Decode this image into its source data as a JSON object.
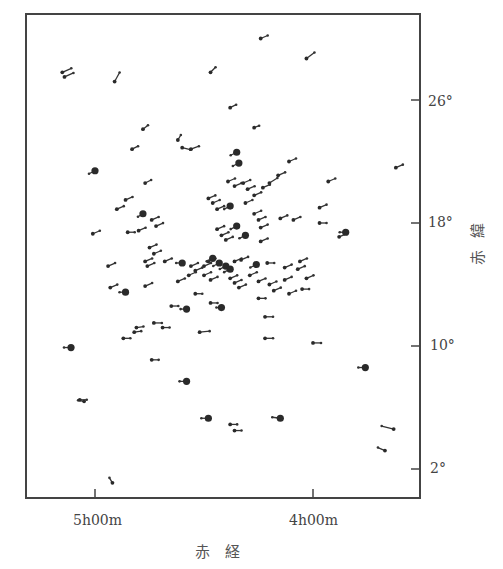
{
  "chart_data": {
    "type": "scatter",
    "title": "",
    "xlabel": "赤　経",
    "ylabel": "赤緯",
    "x_axis": {
      "quantity": "Right Ascension",
      "units": "hours",
      "direction": "decreasing to the right",
      "range": [
        5.32,
        3.52
      ],
      "ticks": [
        {
          "value": 5.0,
          "label": "5h00m"
        },
        {
          "value": 4.0,
          "label": "4h00m"
        }
      ]
    },
    "y_axis": {
      "quantity": "Declination",
      "units": "degrees",
      "range": [
        0.1,
        31.6
      ],
      "ticks": [
        {
          "value": 26,
          "label": "26°"
        },
        {
          "value": 18,
          "label": "18°"
        },
        {
          "value": 10,
          "label": "10°"
        },
        {
          "value": 2,
          "label": "2°"
        }
      ],
      "position": "right"
    },
    "grid": false,
    "legend": null,
    "marker_note": "Each star drawn as a dot with a short proper-motion line (pointing roughly toward upper-left / east); larger filled dots denote brighter stars.",
    "stars": [
      {
        "ra": 5.15,
        "dec": 27.8,
        "size": "s",
        "dx": 9,
        "dy": -4
      },
      {
        "ra": 5.14,
        "dec": 27.5,
        "size": "s",
        "dx": 9,
        "dy": -4
      },
      {
        "ra": 4.91,
        "dec": 27.2,
        "size": "s",
        "dx": 5,
        "dy": -9
      },
      {
        "ra": 4.47,
        "dec": 27.8,
        "size": "s",
        "dx": 5,
        "dy": -5
      },
      {
        "ra": 4.24,
        "dec": 30.0,
        "size": "s",
        "dx": 7,
        "dy": -3
      },
      {
        "ra": 4.03,
        "dec": 28.7,
        "size": "s",
        "dx": 8,
        "dy": -6
      },
      {
        "ra": 4.38,
        "dec": 25.5,
        "size": "s",
        "dx": 6,
        "dy": -3
      },
      {
        "ra": 4.78,
        "dec": 24.1,
        "size": "s",
        "dx": 5,
        "dy": -4
      },
      {
        "ra": 4.62,
        "dec": 23.4,
        "size": "s",
        "dx": 3,
        "dy": -5
      },
      {
        "ra": 4.6,
        "dec": 22.9,
        "size": "s",
        "dx": 8,
        "dy": 2
      },
      {
        "ra": 4.56,
        "dec": 22.8,
        "size": "s",
        "dx": 8,
        "dy": -3
      },
      {
        "ra": 4.83,
        "dec": 22.8,
        "size": "s",
        "dx": 6,
        "dy": -3
      },
      {
        "ra": 4.27,
        "dec": 24.2,
        "size": "s",
        "dx": 5,
        "dy": -2
      },
      {
        "ra": 4.35,
        "dec": 22.6,
        "size": "L",
        "dx": -6,
        "dy": 3
      },
      {
        "ra": 4.34,
        "dec": 21.9,
        "size": "L",
        "dx": -6,
        "dy": 3
      },
      {
        "ra": 4.11,
        "dec": 22.0,
        "size": "s",
        "dx": 7,
        "dy": -3
      },
      {
        "ra": 4.16,
        "dec": 21.1,
        "size": "s",
        "dx": 7,
        "dy": -3
      },
      {
        "ra": 4.2,
        "dec": 20.6,
        "size": "s",
        "dx": 8,
        "dy": -5
      },
      {
        "ra": 4.23,
        "dec": 20.3,
        "size": "s",
        "dx": 7,
        "dy": -3
      },
      {
        "ra": 4.39,
        "dec": 20.7,
        "size": "s",
        "dx": 7,
        "dy": -3
      },
      {
        "ra": 4.36,
        "dec": 20.4,
        "size": "s",
        "dx": 7,
        "dy": -3
      },
      {
        "ra": 4.32,
        "dec": 20.6,
        "size": "s",
        "dx": 7,
        "dy": -3
      },
      {
        "ra": 4.3,
        "dec": 20.2,
        "size": "s",
        "dx": 7,
        "dy": -3
      },
      {
        "ra": 4.27,
        "dec": 19.8,
        "size": "s",
        "dx": 7,
        "dy": -3
      },
      {
        "ra": 5.0,
        "dec": 21.4,
        "size": "L",
        "dx": -6,
        "dy": 3
      },
      {
        "ra": 4.77,
        "dec": 20.6,
        "size": "s",
        "dx": 6,
        "dy": -3
      },
      {
        "ra": 3.93,
        "dec": 20.7,
        "size": "s",
        "dx": 7,
        "dy": -3
      },
      {
        "ra": 3.62,
        "dec": 21.6,
        "size": "s",
        "dx": 7,
        "dy": -3
      },
      {
        "ra": 4.86,
        "dec": 19.5,
        "size": "s",
        "dx": 7,
        "dy": -3
      },
      {
        "ra": 4.9,
        "dec": 18.9,
        "size": "s",
        "dx": 7,
        "dy": -3
      },
      {
        "ra": 4.48,
        "dec": 19.6,
        "size": "s",
        "dx": 7,
        "dy": -3
      },
      {
        "ra": 4.46,
        "dec": 19.3,
        "size": "s",
        "dx": 7,
        "dy": -3
      },
      {
        "ra": 4.44,
        "dec": 18.9,
        "size": "s",
        "dx": 7,
        "dy": -3
      },
      {
        "ra": 4.38,
        "dec": 19.1,
        "size": "L",
        "dx": -6,
        "dy": 3
      },
      {
        "ra": 4.31,
        "dec": 19.3,
        "size": "s",
        "dx": 7,
        "dy": -3
      },
      {
        "ra": 4.27,
        "dec": 18.6,
        "size": "s",
        "dx": 7,
        "dy": -3
      },
      {
        "ra": 4.25,
        "dec": 18.2,
        "size": "s",
        "dx": 7,
        "dy": -3
      },
      {
        "ra": 4.15,
        "dec": 18.3,
        "size": "s",
        "dx": 7,
        "dy": -3
      },
      {
        "ra": 3.97,
        "dec": 19.0,
        "size": "s",
        "dx": 7,
        "dy": -3
      },
      {
        "ra": 4.78,
        "dec": 18.6,
        "size": "L",
        "dx": -5,
        "dy": 3
      },
      {
        "ra": 4.74,
        "dec": 18.2,
        "size": "s",
        "dx": 7,
        "dy": -3
      },
      {
        "ra": 4.72,
        "dec": 17.8,
        "size": "s",
        "dx": 7,
        "dy": -3
      },
      {
        "ra": 4.35,
        "dec": 17.8,
        "size": "L",
        "dx": -6,
        "dy": 3
      },
      {
        "ra": 4.31,
        "dec": 17.2,
        "size": "L",
        "dx": -6,
        "dy": 3
      },
      {
        "ra": 4.44,
        "dec": 17.6,
        "size": "s",
        "dx": 7,
        "dy": -3
      },
      {
        "ra": 4.42,
        "dec": 17.2,
        "size": "s",
        "dx": 7,
        "dy": -3
      },
      {
        "ra": 4.4,
        "dec": 16.9,
        "size": "s",
        "dx": 7,
        "dy": -3
      },
      {
        "ra": 4.24,
        "dec": 17.7,
        "size": "s",
        "dx": 7,
        "dy": -3
      },
      {
        "ra": 4.24,
        "dec": 16.8,
        "size": "s",
        "dx": 7,
        "dy": -3
      },
      {
        "ra": 3.97,
        "dec": 18.0,
        "size": "s",
        "dx": 7,
        "dy": 0
      },
      {
        "ra": 4.09,
        "dec": 18.2,
        "size": "s",
        "dx": 7,
        "dy": -3
      },
      {
        "ra": 3.88,
        "dec": 17.1,
        "size": "s",
        "dx": 7,
        "dy": -3
      },
      {
        "ra": 3.85,
        "dec": 17.4,
        "size": "L",
        "dx": -6,
        "dy": 0
      },
      {
        "ra": 5.01,
        "dec": 17.3,
        "size": "s",
        "dx": 7,
        "dy": -3
      },
      {
        "ra": 4.85,
        "dec": 17.4,
        "size": "s",
        "dx": 7,
        "dy": 0
      },
      {
        "ra": 4.8,
        "dec": 17.5,
        "size": "s",
        "dx": 7,
        "dy": -3
      },
      {
        "ra": 4.75,
        "dec": 16.4,
        "size": "s",
        "dx": 7,
        "dy": -3
      },
      {
        "ra": 4.73,
        "dec": 16.0,
        "size": "s",
        "dx": 7,
        "dy": -3
      },
      {
        "ra": 4.77,
        "dec": 15.5,
        "size": "s",
        "dx": 7,
        "dy": -3
      },
      {
        "ra": 4.76,
        "dec": 15.2,
        "size": "s",
        "dx": 7,
        "dy": -3
      },
      {
        "ra": 4.68,
        "dec": 15.5,
        "size": "s",
        "dx": 7,
        "dy": -3
      },
      {
        "ra": 4.94,
        "dec": 15.2,
        "size": "s",
        "dx": 7,
        "dy": -3
      },
      {
        "ra": 4.6,
        "dec": 15.4,
        "size": "L",
        "dx": -6,
        "dy": 0
      },
      {
        "ra": 4.56,
        "dec": 15.2,
        "size": "s",
        "dx": 7,
        "dy": -3
      },
      {
        "ra": 4.54,
        "dec": 14.9,
        "size": "s",
        "dx": 7,
        "dy": -3
      },
      {
        "ra": 4.5,
        "dec": 15.2,
        "size": "s",
        "dx": 7,
        "dy": -3
      },
      {
        "ra": 4.48,
        "dec": 15.5,
        "size": "s",
        "dx": 7,
        "dy": -3
      },
      {
        "ra": 4.46,
        "dec": 15.7,
        "size": "L",
        "dx": -6,
        "dy": 3
      },
      {
        "ra": 4.43,
        "dec": 15.4,
        "size": "L",
        "dx": -6,
        "dy": 3
      },
      {
        "ra": 4.4,
        "dec": 15.2,
        "size": "L",
        "dx": -6,
        "dy": 3
      },
      {
        "ra": 4.38,
        "dec": 15.0,
        "size": "L",
        "dx": -6,
        "dy": 3
      },
      {
        "ra": 4.36,
        "dec": 15.5,
        "size": "s",
        "dx": 7,
        "dy": -3
      },
      {
        "ra": 4.33,
        "dec": 15.6,
        "size": "s",
        "dx": 7,
        "dy": -3
      },
      {
        "ra": 4.26,
        "dec": 15.3,
        "size": "L",
        "dx": -6,
        "dy": 3
      },
      {
        "ra": 4.21,
        "dec": 15.4,
        "size": "s",
        "dx": 7,
        "dy": 0
      },
      {
        "ra": 4.13,
        "dec": 15.1,
        "size": "s",
        "dx": 7,
        "dy": -3
      },
      {
        "ra": 4.06,
        "dec": 15.5,
        "size": "s",
        "dx": 7,
        "dy": -3
      },
      {
        "ra": 4.07,
        "dec": 15.0,
        "size": "s",
        "dx": 7,
        "dy": -3
      },
      {
        "ra": 4.57,
        "dec": 14.6,
        "size": "s",
        "dx": 7,
        "dy": -3
      },
      {
        "ra": 4.5,
        "dec": 14.6,
        "size": "s",
        "dx": 7,
        "dy": -3
      },
      {
        "ra": 4.47,
        "dec": 14.3,
        "size": "s",
        "dx": 7,
        "dy": -3
      },
      {
        "ra": 4.38,
        "dec": 14.4,
        "size": "s",
        "dx": 7,
        "dy": -3
      },
      {
        "ra": 4.36,
        "dec": 14.1,
        "size": "s",
        "dx": 7,
        "dy": -3
      },
      {
        "ra": 4.34,
        "dec": 13.8,
        "size": "s",
        "dx": 7,
        "dy": -3
      },
      {
        "ra": 4.29,
        "dec": 14.6,
        "size": "s",
        "dx": 7,
        "dy": -3
      },
      {
        "ra": 4.25,
        "dec": 14.2,
        "size": "s",
        "dx": 7,
        "dy": -3
      },
      {
        "ra": 4.2,
        "dec": 14.0,
        "size": "s",
        "dx": 7,
        "dy": -3
      },
      {
        "ra": 4.13,
        "dec": 14.3,
        "size": "s",
        "dx": 7,
        "dy": -3
      },
      {
        "ra": 4.03,
        "dec": 14.4,
        "size": "s",
        "dx": 7,
        "dy": -3
      },
      {
        "ra": 4.18,
        "dec": 13.6,
        "size": "s",
        "dx": 7,
        "dy": -3
      },
      {
        "ra": 4.11,
        "dec": 13.4,
        "size": "s",
        "dx": 7,
        "dy": -3
      },
      {
        "ra": 4.05,
        "dec": 13.7,
        "size": "s",
        "dx": 7,
        "dy": 0
      },
      {
        "ra": 4.77,
        "dec": 13.9,
        "size": "s",
        "dx": 7,
        "dy": -3
      },
      {
        "ra": 4.62,
        "dec": 14.2,
        "size": "s",
        "dx": 7,
        "dy": -3
      },
      {
        "ra": 4.54,
        "dec": 13.4,
        "size": "s",
        "dx": 7,
        "dy": 0
      },
      {
        "ra": 4.86,
        "dec": 13.5,
        "size": "L",
        "dx": -6,
        "dy": 0
      },
      {
        "ra": 4.93,
        "dec": 13.8,
        "size": "s",
        "dx": 7,
        "dy": -3
      },
      {
        "ra": 4.65,
        "dec": 12.6,
        "size": "s",
        "dx": 7,
        "dy": 0
      },
      {
        "ra": 4.58,
        "dec": 12.4,
        "size": "L",
        "dx": -6,
        "dy": 0
      },
      {
        "ra": 4.47,
        "dec": 12.8,
        "size": "s",
        "dx": 7,
        "dy": 0
      },
      {
        "ra": 4.42,
        "dec": 12.5,
        "size": "L",
        "dx": -5,
        "dy": 0
      },
      {
        "ra": 4.25,
        "dec": 13.1,
        "size": "s",
        "dx": 7,
        "dy": 0
      },
      {
        "ra": 4.22,
        "dec": 11.9,
        "size": "s",
        "dx": 8,
        "dy": 0
      },
      {
        "ra": 4.73,
        "dec": 11.5,
        "size": "s",
        "dx": 8,
        "dy": 0
      },
      {
        "ra": 4.81,
        "dec": 11.2,
        "size": "s",
        "dx": 7,
        "dy": -1
      },
      {
        "ra": 4.82,
        "dec": 10.9,
        "size": "s",
        "dx": 7,
        "dy": -1
      },
      {
        "ra": 4.69,
        "dec": 11.2,
        "size": "s",
        "dx": 7,
        "dy": 0
      },
      {
        "ra": 4.87,
        "dec": 10.5,
        "size": "s",
        "dx": 7,
        "dy": 0
      },
      {
        "ra": 4.52,
        "dec": 10.9,
        "size": "s",
        "dx": 10,
        "dy": -1
      },
      {
        "ra": 4.22,
        "dec": 10.5,
        "size": "s",
        "dx": 8,
        "dy": 0
      },
      {
        "ra": 4.0,
        "dec": 10.2,
        "size": "s",
        "dx": 8,
        "dy": 0
      },
      {
        "ra": 5.11,
        "dec": 9.9,
        "size": "L",
        "dx": -7,
        "dy": 0
      },
      {
        "ra": 4.74,
        "dec": 9.1,
        "size": "s",
        "dx": 7,
        "dy": 0
      },
      {
        "ra": 4.58,
        "dec": 7.7,
        "size": "L",
        "dx": -7,
        "dy": 0
      },
      {
        "ra": 3.76,
        "dec": 8.6,
        "size": "L",
        "dx": -7,
        "dy": 0
      },
      {
        "ra": 5.05,
        "dec": 6.4,
        "size": "s",
        "dx": -6,
        "dy": -1
      },
      {
        "ra": 5.07,
        "dec": 6.5,
        "size": "s",
        "dx": 7,
        "dy": 0
      },
      {
        "ra": 4.48,
        "dec": 5.3,
        "size": "L",
        "dx": -7,
        "dy": 0
      },
      {
        "ra": 4.38,
        "dec": 4.9,
        "size": "s",
        "dx": 7,
        "dy": 0
      },
      {
        "ra": 4.36,
        "dec": 4.5,
        "size": "s",
        "dx": 7,
        "dy": 0
      },
      {
        "ra": 4.15,
        "dec": 5.3,
        "size": "L",
        "dx": -8,
        "dy": -1
      },
      {
        "ra": 3.63,
        "dec": 4.6,
        "size": "s",
        "dx": -12,
        "dy": -3
      },
      {
        "ra": 3.67,
        "dec": 3.2,
        "size": "s",
        "dx": -7,
        "dy": -3
      },
      {
        "ra": 4.92,
        "dec": 1.1,
        "size": "s",
        "dx": -3,
        "dy": -5
      }
    ]
  }
}
